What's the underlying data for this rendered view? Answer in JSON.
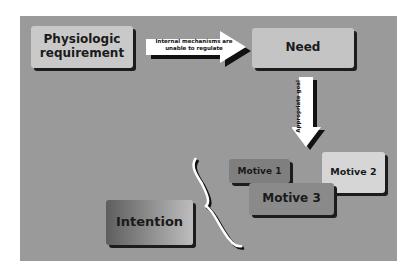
{
  "diagram": {
    "nodes": [
      {
        "id": "phys",
        "label": "Physiologic requirement"
      },
      {
        "id": "need",
        "label": "Need"
      },
      {
        "id": "m1",
        "label": "Motive 1"
      },
      {
        "id": "m2",
        "label": "Motive 2"
      },
      {
        "id": "m3",
        "label": "Motive 3"
      },
      {
        "id": "intent",
        "label": "Intention"
      }
    ],
    "edges": [
      {
        "from": "phys",
        "to": "need",
        "label": "Internal mechanisms are unable to regulate"
      },
      {
        "from": "need",
        "to": "motives",
        "label": "Appropriate goal"
      },
      {
        "from": "motives",
        "to": "intent",
        "label": "",
        "style": "brace"
      }
    ]
  },
  "colors": {
    "background": "#9a9a9a",
    "arrow": "#ffffff",
    "shadow": "#1c1c1c"
  }
}
